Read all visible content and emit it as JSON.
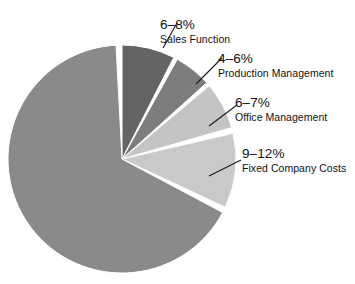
{
  "chart_data": {
    "type": "pie",
    "title": "",
    "subtitle": "",
    "xlabel": "",
    "ylabel": "",
    "legend_position": "none",
    "grid": false,
    "start_angle_deg": 0,
    "direction": "clockwise",
    "exploded": true,
    "background_color": "#ffffff",
    "separator_color": "#ffffff",
    "center": {
      "x": 122,
      "y": 159
    },
    "radius": 114,
    "categories": [
      "Sales Function",
      "Production Management",
      "Office Management",
      "Fixed Company Costs",
      ""
    ],
    "value_labels": [
      "6–8%",
      "4–6%",
      "6–7%",
      "9–12%",
      ""
    ],
    "values": [
      7,
      5,
      6.5,
      10.5,
      71
    ],
    "colors": [
      "#646464",
      "#7d7d7d",
      "#c4c4c4",
      "#c9c9c9",
      "#8a8a8a"
    ],
    "slices": [
      {
        "label": "Sales Function",
        "value_label": "6–8%",
        "low": 6,
        "high": 8,
        "value": 7,
        "color": "#646464",
        "start_deg": 0,
        "end_deg": 27,
        "labeled": true
      },
      {
        "label": "Production Management",
        "value_label": "4–6%",
        "low": 4,
        "high": 6,
        "value": 5,
        "color": "#7d7d7d",
        "start_deg": 29,
        "end_deg": 48,
        "labeled": true
      },
      {
        "label": "Office Management",
        "value_label": "6–7%",
        "low": 6,
        "high": 7,
        "value": 6.5,
        "color": "#c4c4c4",
        "start_deg": 50,
        "end_deg": 74,
        "labeled": true
      },
      {
        "label": "Fixed Company Costs",
        "value_label": "9–12%",
        "low": 9,
        "high": 12,
        "value": 10.5,
        "color": "#c9c9c9",
        "start_deg": 77,
        "end_deg": 115,
        "labeled": true
      },
      {
        "label": "",
        "value_label": "",
        "value": 71,
        "color": "#8a8a8a",
        "start_deg": 118,
        "end_deg": 357,
        "labeled": false
      }
    ]
  },
  "labels": [
    {
      "pct": "6–8%",
      "name": "Sales Function"
    },
    {
      "pct": "4–6%",
      "name": "Production Management"
    },
    {
      "pct": "6–7%",
      "name": "Office Management"
    },
    {
      "pct": "9–12%",
      "name": "Fixed Company Costs"
    }
  ]
}
